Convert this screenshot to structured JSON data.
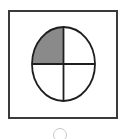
{
  "option": {
    "label": "Circle with one quarter shaded",
    "selected": false,
    "figure": {
      "shape": "ellipse",
      "divisions": 4,
      "shaded_quadrants": [
        "top-left"
      ],
      "shaded_fraction": "1/4",
      "colors": {
        "stroke": "#1e1e1e",
        "shade": "#8a8a8a",
        "fill": "#ffffff",
        "border": "#3a3a3a"
      }
    }
  }
}
